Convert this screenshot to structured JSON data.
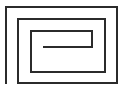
{
  "figure": {
    "name": "rectangular-spiral",
    "shape_type": "line-drawing",
    "background_color": "#ffffff",
    "stroke_color": "#2b2b2b",
    "stroke_width": 2,
    "canvas": {
      "width": 124,
      "height": 91
    },
    "turns": 3,
    "winding_direction": "inward-clockwise",
    "open_side": "left",
    "rings": [
      {
        "name": "outer-ring",
        "left": 6,
        "top": 7,
        "right": 117,
        "bottom": 83
      },
      {
        "name": "middle-ring",
        "left": 18,
        "top": 19,
        "right": 105,
        "bottom": 72
      },
      {
        "name": "inner-ring",
        "left": 31,
        "top": 31,
        "right": 92,
        "bottom": 60
      }
    ],
    "center_tongue": {
      "name": "center-tongue",
      "x_start": 44,
      "x_end": 92,
      "y": 47
    },
    "path_d": "M 6 83 L 6 7 L 117 7 L 117 83 L 18 83 L 18 19 L 105 19 L 105 72 L 31 72 L 31 31 L 92 31 L 92 47 L 44 47"
  },
  "labels": {
    "caption": ""
  }
}
